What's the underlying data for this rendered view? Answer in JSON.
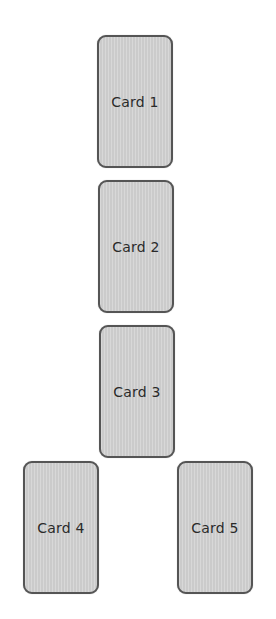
{
  "cards": [
    {
      "label": "Card 1",
      "x": 97,
      "y": 35
    },
    {
      "label": "Card 2",
      "x": 98,
      "y": 180
    },
    {
      "label": "Card 3",
      "x": 99,
      "y": 325
    },
    {
      "label": "Card 4",
      "x": 23,
      "y": 461
    },
    {
      "label": "Card 5",
      "x": 177,
      "y": 461
    }
  ],
  "colors": {
    "card_fill": "#d3d3d3",
    "card_border": "#555555",
    "text": "#2a2a2a",
    "background": "#ffffff"
  }
}
